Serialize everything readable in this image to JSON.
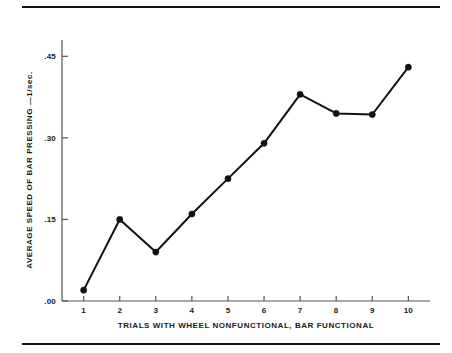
{
  "figure": {
    "top_rule": "horizontal-rule",
    "bottom_rule": "horizontal-rule"
  },
  "chart_data": {
    "type": "line",
    "title": "",
    "subtitle": "",
    "xlabel": "TRIALS WITH WHEEL NONFUNCTIONAL, BAR FUNCTIONAL",
    "ylabel": "AVERAGE SPEED OF BAR PRESSING —1/sec.",
    "x": [
      1,
      2,
      3,
      4,
      5,
      6,
      7,
      8,
      9,
      10
    ],
    "values": [
      0.02,
      0.15,
      0.09,
      0.16,
      0.225,
      0.29,
      0.38,
      0.345,
      0.343,
      0.43
    ],
    "xticklabels": [
      "1",
      "2",
      "3",
      "4",
      "5",
      "6",
      "7",
      "8",
      "9",
      "10"
    ],
    "yticks": [
      0.0,
      0.15,
      0.3,
      0.45
    ],
    "yticklabels": [
      ".00",
      ".15",
      ".30",
      ".45"
    ],
    "xlim": [
      0.4,
      10.6
    ],
    "ylim": [
      0.0,
      0.48
    ],
    "grid": false,
    "legend": null,
    "marker": "filled-circle",
    "line_color": "#111111",
    "marker_color": "#111111",
    "axis_color": "#555555"
  }
}
